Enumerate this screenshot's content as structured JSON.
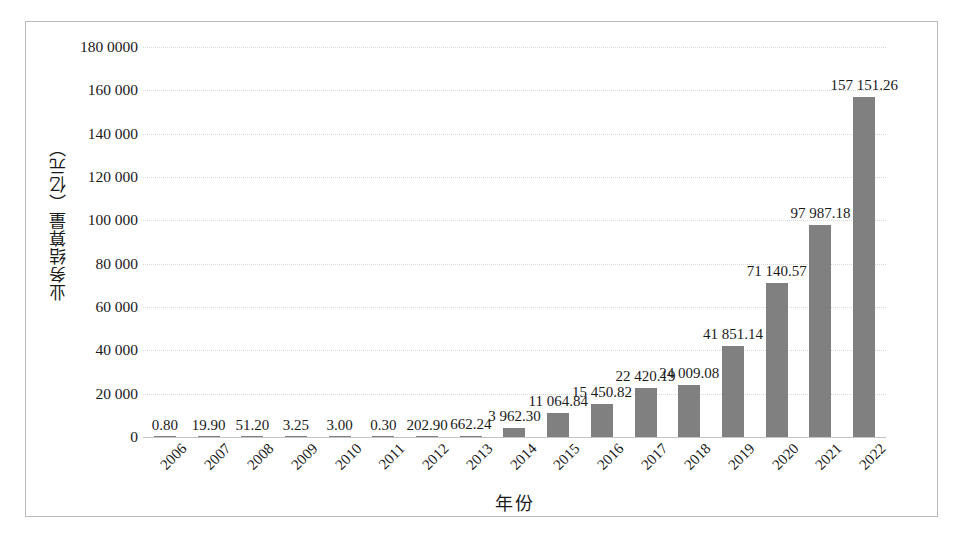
{
  "chart_data": {
    "type": "bar",
    "title": "",
    "xlabel": "年份",
    "ylabel": "业务结算量（亿元）",
    "categories": [
      "2006",
      "2007",
      "2008",
      "2009",
      "2010",
      "2011",
      "2012",
      "2013",
      "2014",
      "2015",
      "2016",
      "2017",
      "2018",
      "2019",
      "2020",
      "2021",
      "2022"
    ],
    "values": [
      0.8,
      19.9,
      51.2,
      3.25,
      3.0,
      0.3,
      202.9,
      662.24,
      3962.3,
      11064.84,
      15450.82,
      22420.19,
      24009.08,
      41851.14,
      71140.57,
      97987.18,
      157151.26
    ],
    "value_labels": [
      "0.80",
      "19.90",
      "51.20",
      "3.25",
      "3.00",
      "0.30",
      "202.90",
      "662.24",
      "3 962.30",
      "11 064.84",
      "15 450.82",
      "22 420.19",
      "24 009.08",
      "41 851.14",
      "71 140.57",
      "97 987.18",
      "157 151.26"
    ],
    "ylim": [
      0,
      180000
    ],
    "ytick_values": [
      0,
      20000,
      40000,
      60000,
      80000,
      100000,
      120000,
      140000,
      160000,
      180000
    ],
    "ytick_labels": [
      "0",
      "20 000",
      "40 000",
      "60 000",
      "80 000",
      "100 000",
      "120 000",
      "140 000",
      "160 000",
      "180 0000"
    ],
    "grid": true,
    "legend": "none",
    "bar_color": "#808080",
    "grid_color": "#d9d9d9",
    "axis_color": "#c4c4c4",
    "frame_color": "#b9b9b9",
    "xtick_rotation_deg": -45
  }
}
